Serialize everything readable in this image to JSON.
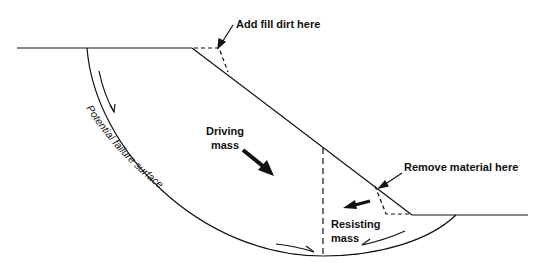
{
  "diagram": {
    "colors": {
      "line": "#111111",
      "background": "#ffffff"
    },
    "labels": {
      "add_fill": "Add fill dirt here",
      "driving_line1": "Driving",
      "driving_line2": "mass",
      "remove_material": "Remove material here",
      "resisting_line1": "Resisting",
      "resisting_line2": "mass",
      "failure_surface": "Potential failure surface"
    },
    "elements": [
      "upper-ground-surface",
      "slope-face",
      "lower-ground-surface",
      "failure-arc",
      "dashed-divider",
      "fill-wedge-dashed",
      "removal-wedge-dashed",
      "driving-arrow",
      "resisting-arrow",
      "arc-motion-arrows"
    ]
  }
}
